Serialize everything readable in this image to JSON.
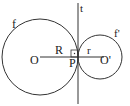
{
  "diagram": {
    "labels": {
      "circle_large": "f",
      "circle_small": "f'",
      "tangent_line": "t",
      "center_large": "O",
      "center_small": "O'",
      "tangent_point": "P",
      "radius_large": "R",
      "radius_small": "r"
    },
    "colors": {
      "stroke": "#333333",
      "text": "#222222",
      "background": "#ffffff"
    }
  }
}
